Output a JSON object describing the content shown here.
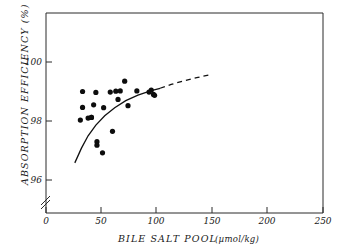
{
  "chart_data": {
    "type": "scatter",
    "title": "",
    "xlabel": "BILE SALT POOL",
    "xunit": "(µmol/kg)",
    "ylabel": "ABSORPTION EFFICIENCY (%)",
    "xlim": [
      0,
      250
    ],
    "ylim": [
      95.6,
      100.6
    ],
    "xticks": [
      0,
      50,
      100,
      150,
      200,
      250
    ],
    "yticks": [
      96,
      98,
      100
    ],
    "xtick_labels": [
      "0",
      "50",
      "100",
      "150",
      "200",
      "250"
    ],
    "ytick_labels": [
      "96",
      "98",
      "100"
    ],
    "grid": false,
    "legend": null,
    "y_axis_break": true,
    "points": [
      {
        "x": 31,
        "y": 98.03
      },
      {
        "x": 33,
        "y": 98.46
      },
      {
        "x": 33,
        "y": 99.0
      },
      {
        "x": 38,
        "y": 98.1
      },
      {
        "x": 41,
        "y": 98.12
      },
      {
        "x": 41,
        "y": 98.12
      },
      {
        "x": 43,
        "y": 98.55
      },
      {
        "x": 45,
        "y": 98.97
      },
      {
        "x": 46,
        "y": 97.3
      },
      {
        "x": 46,
        "y": 97.18
      },
      {
        "x": 51,
        "y": 96.92
      },
      {
        "x": 52,
        "y": 98.45
      },
      {
        "x": 58,
        "y": 98.98
      },
      {
        "x": 60,
        "y": 97.65
      },
      {
        "x": 63,
        "y": 99.01
      },
      {
        "x": 65,
        "y": 98.73
      },
      {
        "x": 67,
        "y": 99.02
      },
      {
        "x": 71,
        "y": 99.35
      },
      {
        "x": 74,
        "y": 98.52
      },
      {
        "x": 82,
        "y": 99.02
      },
      {
        "x": 93,
        "y": 98.98
      },
      {
        "x": 95,
        "y": 99.05
      },
      {
        "x": 97,
        "y": 98.9
      },
      {
        "x": 98,
        "y": 98.87
      }
    ],
    "fit_curve_solid": {
      "style": "solid",
      "x": [
        26,
        32,
        38,
        45,
        53,
        62,
        72,
        83,
        95,
        103
      ],
      "y": [
        96.58,
        97.08,
        97.5,
        97.86,
        98.18,
        98.45,
        98.69,
        98.88,
        99.03,
        99.11
      ]
    },
    "fit_curve_dashed": {
      "style": "dashed",
      "x": [
        103,
        113,
        124,
        136,
        150
      ],
      "y": [
        99.11,
        99.24,
        99.36,
        99.47,
        99.58
      ]
    }
  }
}
